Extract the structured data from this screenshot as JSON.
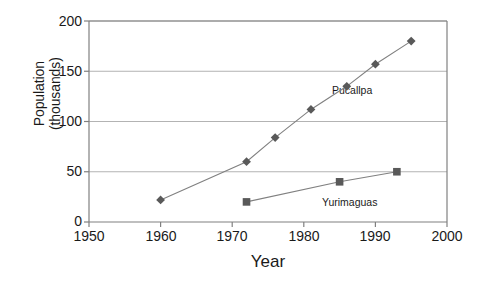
{
  "chart_data": {
    "type": "line",
    "title": "",
    "xlabel": "Year",
    "ylabel": "Population\n(thousands)",
    "xlim": [
      1950,
      2000
    ],
    "ylim": [
      0,
      200
    ],
    "xticks": [
      1950,
      1960,
      1970,
      1980,
      1990,
      2000
    ],
    "yticks": [
      0,
      50,
      100,
      150,
      200
    ],
    "grid": "horizontal",
    "legend_position": "inline-annotation",
    "marker_color": "#595959",
    "line_color": "#808080",
    "axis_color": "#808080",
    "grid_color": "#b3b3b3",
    "series": [
      {
        "name": "Pucallpa",
        "marker": "diamond",
        "x": [
          1960,
          1972,
          1976,
          1981,
          1986,
          1990,
          1995
        ],
        "values": [
          22,
          60,
          84,
          112,
          135,
          157,
          180
        ]
      },
      {
        "name": "Yurimaguas",
        "marker": "square",
        "x": [
          1972,
          1985,
          1993
        ],
        "values": [
          20,
          40,
          50
        ]
      }
    ]
  }
}
